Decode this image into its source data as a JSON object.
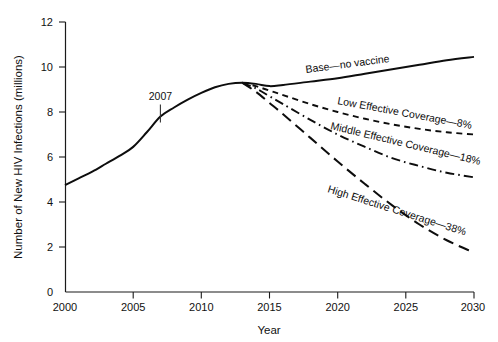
{
  "chart_data": {
    "type": "line",
    "title": "",
    "xlabel": "Year",
    "ylabel": "Number of New HIV Infections (millions)",
    "xlim": [
      2000,
      2030
    ],
    "ylim": [
      0,
      12
    ],
    "xticks": [
      "2000",
      "2005",
      "2010",
      "2015",
      "2020",
      "2025",
      "2030"
    ],
    "xtick_values": [
      2000,
      2005,
      2010,
      2015,
      2020,
      2025,
      2030
    ],
    "yticks": [
      "0",
      "2",
      "4",
      "6",
      "8",
      "10",
      "12"
    ],
    "ytick_values": [
      0,
      2,
      4,
      6,
      8,
      10,
      12
    ],
    "grid": false,
    "legend_position": "inline-curve-labels",
    "annotations": [
      {
        "text": "2007",
        "x": 2007,
        "y": 7.8
      }
    ],
    "series": [
      {
        "name": "Base—no vaccine",
        "label": "Base—no vaccine",
        "linestyle": "solid",
        "x": [
          2000,
          2001,
          2002,
          2003,
          2004,
          2005,
          2006,
          2007,
          2008,
          2009,
          2010,
          2011,
          2012,
          2013,
          2014,
          2015,
          2016,
          2018,
          2020,
          2022,
          2024,
          2026,
          2028,
          2030
        ],
        "values": [
          4.75,
          5.05,
          5.35,
          5.7,
          6.05,
          6.45,
          7.1,
          7.8,
          8.2,
          8.55,
          8.85,
          9.1,
          9.25,
          9.3,
          9.25,
          9.15,
          9.2,
          9.35,
          9.5,
          9.7,
          9.9,
          10.1,
          10.3,
          10.45
        ]
      },
      {
        "name": "Low Effective Coverage—8%",
        "label": "Low Effective Coverage—8%",
        "linestyle": "dashed-short",
        "x": [
          2013,
          2014,
          2015,
          2016,
          2018,
          2020,
          2022,
          2024,
          2026,
          2028,
          2030
        ],
        "values": [
          9.3,
          9.15,
          8.95,
          8.75,
          8.35,
          8.0,
          7.7,
          7.45,
          7.25,
          7.1,
          7.0
        ]
      },
      {
        "name": "Middle Effective Coverage—18%",
        "label": "Middle Effective Coverage—18%",
        "linestyle": "dash-dot",
        "x": [
          2013,
          2014,
          2015,
          2016,
          2018,
          2020,
          2022,
          2024,
          2026,
          2028,
          2030
        ],
        "values": [
          9.3,
          9.05,
          8.7,
          8.35,
          7.65,
          7.0,
          6.45,
          5.95,
          5.6,
          5.3,
          5.1
        ]
      },
      {
        "name": "High Effective Coverage—38%",
        "label": "High Effective Coverage—38%",
        "linestyle": "dashed-long",
        "x": [
          2013,
          2014,
          2015,
          2016,
          2018,
          2020,
          2022,
          2024,
          2026,
          2028,
          2030
        ],
        "values": [
          9.3,
          8.9,
          8.4,
          7.9,
          6.85,
          5.8,
          4.8,
          3.85,
          3.0,
          2.3,
          1.75
        ]
      }
    ]
  },
  "axes": {
    "y_title": "Number of New HIV Infections (millions)",
    "x_title": "Year",
    "y_tick_labels": [
      "12",
      "10",
      "8",
      "6",
      "4",
      "2",
      "0"
    ],
    "x_tick_labels": [
      "2000",
      "2005",
      "2010",
      "2015",
      "2020",
      "2025",
      "2030"
    ]
  },
  "series_labels": {
    "base": "Base—no vaccine",
    "low": "Low Effective Coverage—8%",
    "middle": "Middle Effective Coverage—18%",
    "high": "High Effective Coverage—38%"
  },
  "annotations": {
    "year_2007": "2007"
  },
  "colors": {
    "line": "#0d0d0d",
    "axis": "#1a1a1a",
    "background": "#ffffff"
  }
}
